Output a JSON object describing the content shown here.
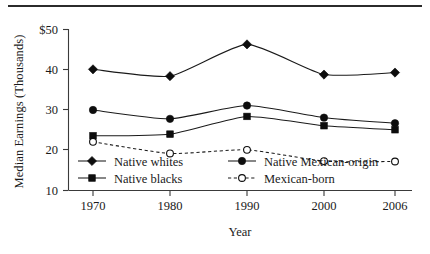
{
  "chart_data": {
    "type": "line",
    "title": "",
    "xlabel": "Year",
    "ylabel": "Median Earnings (Thousands)",
    "x": [
      1970,
      1980,
      1990,
      2000,
      2006
    ],
    "categories": [
      "1970",
      "1980",
      "1990",
      "2000",
      "2006"
    ],
    "xtick_labels": [
      "1970",
      "1980",
      "1990",
      "2000",
      "2006"
    ],
    "ytick_labels": [
      "$50",
      "40",
      "30",
      "20",
      "10"
    ],
    "ytick_values": [
      50,
      40,
      30,
      20,
      10
    ],
    "ylim": [
      10,
      50
    ],
    "xlim": [
      1967,
      2008
    ],
    "grid": false,
    "legend_position": "lower-left-inside",
    "series": [
      {
        "name": "Native whites",
        "marker": "filled-diamond",
        "linestyle": "solid",
        "color": "#0d0d0d",
        "values": [
          40.1,
          38.4,
          46.3,
          38.8,
          39.3
        ]
      },
      {
        "name": "Native Mexican-origin",
        "marker": "filled-circle",
        "linestyle": "solid",
        "color": "#0d0d0d",
        "values": [
          30.0,
          27.8,
          31.1,
          28.1,
          26.7
        ]
      },
      {
        "name": "Native blacks",
        "marker": "filled-square",
        "linestyle": "solid",
        "color": "#0d0d0d",
        "values": [
          23.6,
          24.0,
          28.4,
          26.1,
          25.1
        ]
      },
      {
        "name": "Mexican-born",
        "marker": "open-circle",
        "linestyle": "dashed",
        "color": "#0d0d0d",
        "values": [
          22.1,
          19.2,
          20.1,
          17.3,
          17.2
        ]
      }
    ],
    "legend_entries": [
      {
        "label": "Native whites",
        "marker": "filled-diamond",
        "linestyle": "solid"
      },
      {
        "label": "Native Mexican-origin",
        "marker": "filled-circle",
        "linestyle": "solid"
      },
      {
        "label": "Native blacks",
        "marker": "filled-square",
        "linestyle": "solid"
      },
      {
        "label": "Mexican-born",
        "marker": "open-circle",
        "linestyle": "dashed"
      }
    ]
  }
}
